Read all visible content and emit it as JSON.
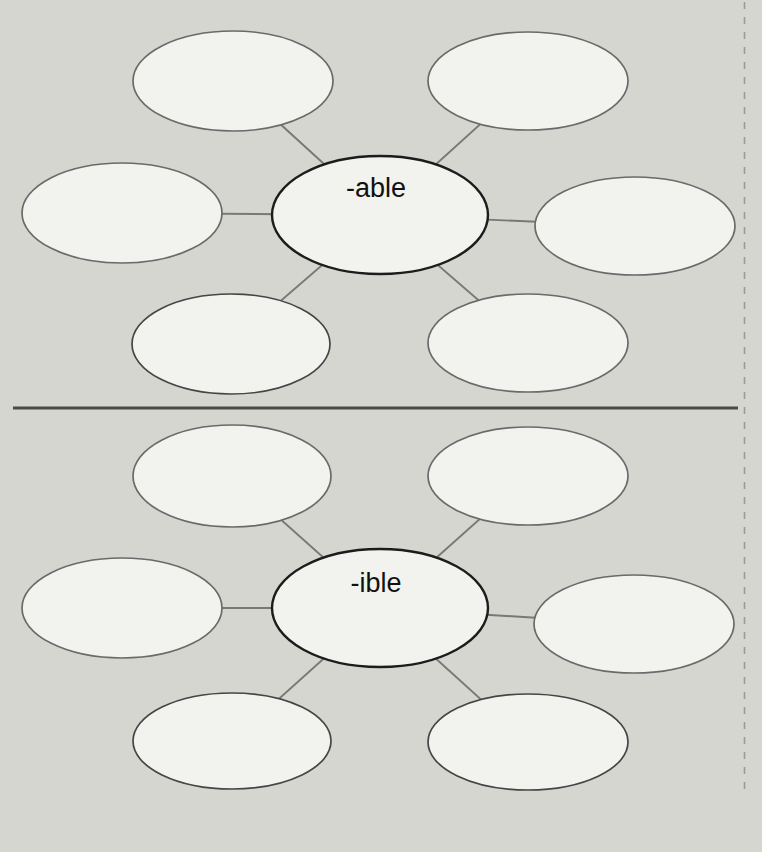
{
  "page": {
    "colors": {
      "background": "#d6d6d1",
      "ellipse_fill": "#f2f3ee",
      "satellite_outline": "#6a6a6a",
      "center_outline": "#1c1c1c",
      "connector": "#787876",
      "divider": "#4a4a48",
      "tear_line": "#9b9b98",
      "text": "#111111"
    },
    "diagrams": [
      {
        "center_label": "-able",
        "satellite_count": 6
      },
      {
        "center_label": "-ible",
        "satellite_count": 6
      }
    ],
    "footer": {
      "page_number": "96",
      "caption": "Sort 24: Adding Suffixes -able, -ible"
    }
  }
}
